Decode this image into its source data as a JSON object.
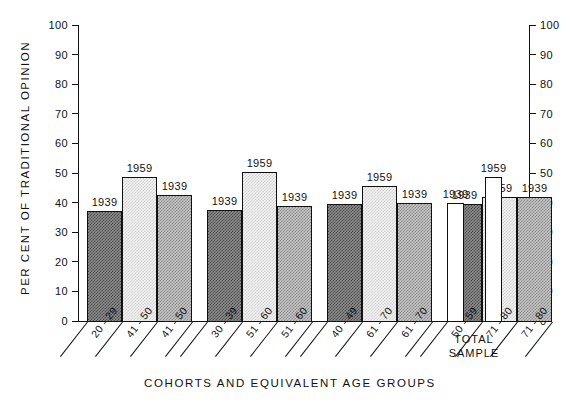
{
  "chart_data": {
    "type": "bar",
    "title": "",
    "xlabel": "COHORTS AND EQUIVALENT AGE GROUPS",
    "ylabel": "PER CENT OF TRADITIONAL OPINION",
    "ylim": [
      0,
      100
    ],
    "ytick_step": 10,
    "yticks": [
      "100",
      "90",
      "80",
      "70",
      "60",
      "50",
      "40",
      "30",
      "20",
      "10",
      "0"
    ],
    "grid": false,
    "legend": "none",
    "dual_axis": true,
    "bar_value_labels_are_years": true,
    "groups": [
      {
        "name": "group-1",
        "bars": [
          {
            "label": "1939",
            "category": "20 - 29",
            "value": 37.0,
            "fill": "dark"
          },
          {
            "label": "1959",
            "category": "41 - 50",
            "value": 48.5,
            "fill": "light"
          },
          {
            "label": "1939",
            "category": "41 - 50",
            "value": 42.5,
            "fill": "medium"
          }
        ]
      },
      {
        "name": "group-2",
        "bars": [
          {
            "label": "1939",
            "category": "30 - 39",
            "value": 37.5,
            "fill": "dark"
          },
          {
            "label": "1959",
            "category": "51 - 60",
            "value": 50.5,
            "fill": "light"
          },
          {
            "label": "1939",
            "category": "51 - 60",
            "value": 39.0,
            "fill": "medium"
          }
        ]
      },
      {
        "name": "group-3",
        "bars": [
          {
            "label": "1939",
            "category": "40 - 49",
            "value": 39.5,
            "fill": "dark"
          },
          {
            "label": "1959",
            "category": "61 - 70",
            "value": 45.5,
            "fill": "light"
          },
          {
            "label": "1939",
            "category": "61 - 70",
            "value": 40.0,
            "fill": "medium"
          }
        ]
      },
      {
        "name": "group-4",
        "bars": [
          {
            "label": "1939",
            "category": "50 - 59",
            "value": 39.5,
            "fill": "dark"
          },
          {
            "label": "1959",
            "category": "71 - 80",
            "value": 42.0,
            "fill": "light"
          },
          {
            "label": "1939",
            "category": "71 - 80",
            "value": 42.0,
            "fill": "medium"
          }
        ]
      },
      {
        "name": "total-sample",
        "bars": [
          {
            "label": "1939",
            "category": "TOTAL SAMPLE",
            "value": 40.0,
            "fill": "blank"
          },
          {
            "label": "1959",
            "category": "TOTAL SAMPLE",
            "value": 48.5,
            "fill": "blank"
          }
        ]
      }
    ],
    "total_sample_caption": [
      "TOTAL",
      "SAMPLE"
    ]
  },
  "colors": {
    "ink": "#111111",
    "background": "#ffffff",
    "fill_dark": "#8e8e8e",
    "fill_light": "#f2f2f2",
    "fill_medium": "#c6c6c6",
    "fill_blank": "#ffffff"
  }
}
